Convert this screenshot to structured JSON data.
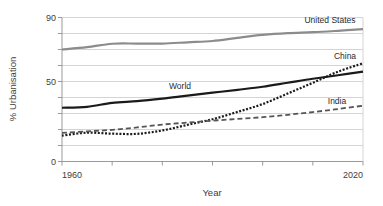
{
  "chart_data": {
    "type": "line",
    "title": "",
    "xlabel": "Year",
    "ylabel": "% Urbanisation",
    "xlim": [
      1960,
      2020
    ],
    "ylim": [
      0,
      90
    ],
    "grid": true,
    "legend_position": "inline-end-of-line",
    "x_ticks": [
      1960,
      1970,
      1980,
      1990,
      2000,
      2010,
      2020
    ],
    "x_tick_labels": [
      "1960",
      "",
      "",
      "",
      "",
      "",
      "2020"
    ],
    "y_ticks": [
      0,
      10,
      20,
      30,
      40,
      50,
      60,
      70,
      80,
      90
    ],
    "y_tick_labels": [
      "0",
      "",
      "",
      "",
      "",
      "50",
      "",
      "",
      "",
      "90"
    ],
    "x": [
      1960,
      1965,
      1970,
      1975,
      1980,
      1985,
      1990,
      1995,
      2000,
      2005,
      2010,
      2015,
      2020
    ],
    "series": [
      {
        "name": "United States",
        "label": "United States",
        "style": "solid",
        "color": "#8c8c8c",
        "width": 2.2,
        "values": [
          70,
          71.5,
          73.6,
          73.7,
          73.7,
          74.5,
          75.3,
          77.3,
          79.1,
          80.2,
          80.8,
          81.7,
          82.7
        ]
      },
      {
        "name": "World",
        "label": "World",
        "style": "solid",
        "color": "#1a1a1a",
        "width": 2.2,
        "values": [
          33.6,
          34.2,
          36.6,
          37.7,
          39.3,
          41.2,
          43.0,
          44.8,
          46.7,
          49.2,
          51.7,
          53.9,
          56.2
        ]
      },
      {
        "name": "China",
        "label": "China",
        "style": "dotted",
        "color": "#1a1a1a",
        "width": 2.2,
        "values": [
          16.2,
          18.0,
          17.4,
          17.3,
          19.4,
          22.9,
          26.4,
          31.0,
          35.9,
          42.5,
          49.2,
          56.1,
          61.4
        ]
      },
      {
        "name": "India",
        "label": "India",
        "style": "dashed",
        "color": "#555555",
        "width": 1.8,
        "values": [
          17.9,
          18.8,
          19.8,
          21.3,
          23.1,
          24.3,
          25.5,
          26.6,
          27.7,
          29.2,
          30.9,
          32.8,
          34.9
        ]
      }
    ]
  },
  "axes": {
    "y_label": "% Urbanisation",
    "x_label": "Year",
    "y_top_label": "90",
    "y_mid_label": "50",
    "y_zero_label": "0",
    "x_start_label": "1960",
    "x_end_label": "2020"
  },
  "labels": {
    "united_states": "United States",
    "china": "China",
    "world": "World",
    "india": "India"
  },
  "colors": {
    "grid": "#c9c9c9",
    "axis": "#9a9a9a",
    "text": "#3d3d3d",
    "us_line": "#8c8c8c",
    "world_line": "#1a1a1a",
    "china_line": "#1a1a1a",
    "india_line": "#555555"
  }
}
